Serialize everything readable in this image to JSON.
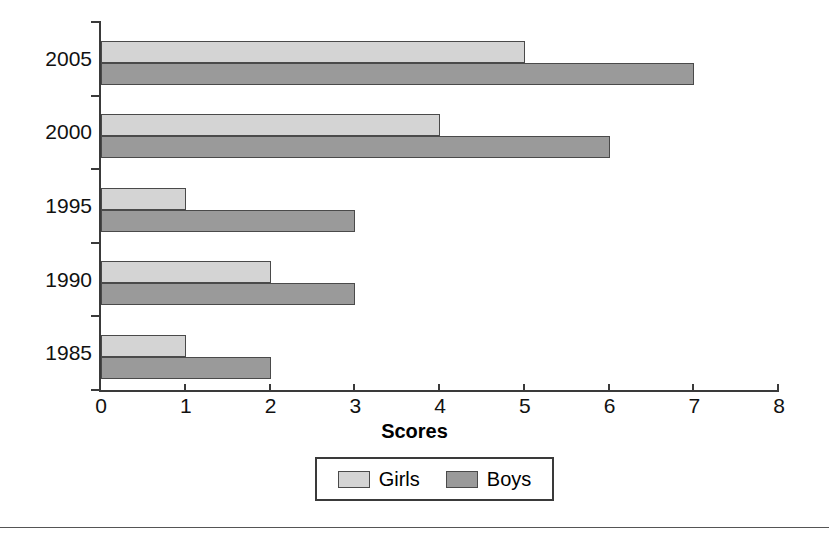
{
  "chart_data": {
    "type": "bar",
    "orientation": "horizontal",
    "title": "",
    "xlabel": "Scores",
    "ylabel": "",
    "categories": [
      "1985",
      "1990",
      "1995",
      "2000",
      "2005"
    ],
    "series": [
      {
        "name": "Girls",
        "color": "#d4d4d4",
        "values": [
          1,
          2,
          1,
          4,
          5
        ]
      },
      {
        "name": "Boys",
        "color": "#9a9a9a",
        "values": [
          2,
          3,
          3,
          6,
          7
        ]
      }
    ],
    "xlim": [
      0,
      8
    ],
    "xticks": [
      "0",
      "1",
      "2",
      "3",
      "4",
      "5",
      "6",
      "7",
      "8"
    ],
    "grid": false,
    "legend_position": "bottom",
    "legend_entries": [
      "Girls",
      "Boys"
    ]
  },
  "axis": {
    "x_title": "Scores",
    "x_tick_labels": [
      "0",
      "1",
      "2",
      "3",
      "4",
      "5",
      "6",
      "7",
      "8"
    ],
    "y_tick_labels": [
      "2005",
      "2000",
      "1995",
      "1990",
      "1985"
    ]
  },
  "legend": {
    "entries": [
      {
        "label": "Girls",
        "color": "#d4d4d4"
      },
      {
        "label": "Boys",
        "color": "#9a9a9a"
      }
    ]
  },
  "colors": {
    "girls": "#d4d4d4",
    "boys": "#9a9a9a",
    "axis": "#3a3a3a",
    "text": "#000000",
    "background": "#ffffff"
  }
}
